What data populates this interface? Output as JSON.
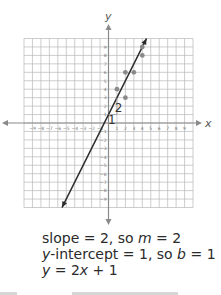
{
  "chart_data": {
    "type": "scatter",
    "title": "",
    "xlabel": "x",
    "ylabel": "y",
    "xlim": [
      -10,
      10
    ],
    "ylim": [
      -10,
      10
    ],
    "grid": true,
    "x_ticks": [
      -9,
      -8,
      -7,
      -6,
      -5,
      -4,
      -3,
      -2,
      -1,
      1,
      2,
      3,
      4,
      5,
      6,
      7,
      8,
      9
    ],
    "y_ticks": [
      -9,
      -8,
      -7,
      -6,
      -5,
      -4,
      -3,
      -2,
      -1,
      1,
      2,
      3,
      4,
      5,
      6,
      7,
      8,
      9
    ],
    "series": [
      {
        "name": "data points",
        "points": [
          [
            1,
            4
          ],
          [
            2,
            3
          ],
          [
            2,
            6
          ],
          [
            3,
            6
          ],
          [
            4,
            8
          ],
          [
            4,
            9
          ]
        ]
      },
      {
        "name": "line of fit",
        "type": "line",
        "equation": "y = 2x + 1",
        "slope": 2,
        "intercept": 1,
        "x_range": [
          -5.5,
          4.5
        ]
      }
    ],
    "annotations": [
      {
        "text": "2",
        "meaning": "rise",
        "x": 0.7,
        "y": 2
      },
      {
        "text": "1",
        "meaning": "run",
        "x": 0.5,
        "y": 0.3
      }
    ]
  },
  "text": {
    "line1": {
      "a": "slope = 2, so ",
      "var": "m",
      "b": " = 2"
    },
    "line2": {
      "var1": "y",
      "a": "-intercept = 1, so ",
      "var2": "b",
      "b": " = 1"
    },
    "line3": {
      "var1": "y",
      "a": " = 2",
      "var2": "x",
      "b": " + 1"
    }
  },
  "colors": {
    "grid": "#b8b8b8",
    "axis": "#8a8a8a",
    "line": "#2b2b2b",
    "points": "#8a8a8a",
    "text": "#2a2a2a"
  }
}
